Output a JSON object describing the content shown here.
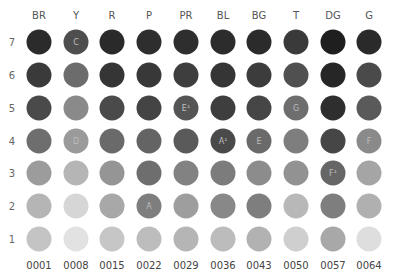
{
  "chart_data": {
    "type": "heatmap",
    "title": "",
    "xlabel": "",
    "ylabel": "",
    "columns": [
      "BR",
      "Y",
      "R",
      "P",
      "PR",
      "BL",
      "BG",
      "T",
      "DG",
      "G"
    ],
    "column_codes": [
      "0001",
      "0008",
      "0015",
      "0022",
      "0029",
      "0036",
      "0043",
      "0050",
      "0057",
      "0064"
    ],
    "rows": [
      "7",
      "6",
      "5",
      "4",
      "3",
      "2",
      "1"
    ],
    "cells": [
      {
        "col": "BR",
        "colors": [
          "#2b2b2b",
          "#3a3a3a",
          "#4a4a4a",
          "#6e6e6e",
          "#9c9c9c",
          "#b5b5b5",
          "#c4c4c4"
        ],
        "labels": [
          "",
          "",
          "",
          "",
          "",
          "",
          ""
        ]
      },
      {
        "col": "Y",
        "colors": [
          "#4e4e4e",
          "#6c6c6c",
          "#8a8a8a",
          "#9a9a9a",
          "#b5b5b5",
          "#d6d6d6",
          "#e2e2e2"
        ],
        "labels": [
          "C",
          "",
          "",
          "D",
          "",
          "",
          ""
        ]
      },
      {
        "col": "R",
        "colors": [
          "#2a2a2a",
          "#353535",
          "#4a4a4a",
          "#6a6a6a",
          "#959595",
          "#a8a8a8",
          "#c6c6c6"
        ],
        "labels": [
          "",
          "",
          "",
          "",
          "",
          "",
          ""
        ]
      },
      {
        "col": "P",
        "colors": [
          "#2e2e2e",
          "#383838",
          "#444444",
          "#646464",
          "#6e6e6e",
          "#7e7e7e",
          "#bdbdbd"
        ],
        "labels": [
          "",
          "",
          "",
          "",
          "",
          "A",
          ""
        ]
      },
      {
        "col": "PR",
        "colors": [
          "#2e2e2e",
          "#3e3e3e",
          "#555555",
          "#5a5a5a",
          "#828282",
          "#9e9e9e",
          "#b5b5b5"
        ],
        "labels": [
          "",
          "",
          "E¹",
          "",
          "",
          "",
          ""
        ]
      },
      {
        "col": "BL",
        "colors": [
          "#2c2c2c",
          "#353535",
          "#3e3e3e",
          "#4a4a4a",
          "#7c7c7c",
          "#888888",
          "#bcbcbc"
        ],
        "labels": [
          "",
          "",
          "",
          "A¹",
          "",
          "",
          ""
        ]
      },
      {
        "col": "BG",
        "colors": [
          "#2b2b2b",
          "#3c3c3c",
          "#464646",
          "#6a6a6a",
          "#8c8c8c",
          "#7e7e7e",
          "#b2b2b2"
        ],
        "labels": [
          "",
          "",
          "",
          "E",
          "",
          "",
          ""
        ]
      },
      {
        "col": "T",
        "colors": [
          "#3a3a3a",
          "#505050",
          "#6e6e6e",
          "#7e7e7e",
          "#929292",
          "#b8b8b8",
          "#cfcfcf"
        ],
        "labels": [
          "",
          "",
          "G",
          "",
          "",
          "",
          ""
        ]
      },
      {
        "col": "DG",
        "colors": [
          "#1f1f1f",
          "#262626",
          "#2e2e2e",
          "#464646",
          "#666666",
          "#7e7e7e",
          "#a8a8a8"
        ],
        "labels": [
          "",
          "",
          "",
          "",
          "F¹",
          "",
          ""
        ]
      },
      {
        "col": "G",
        "colors": [
          "#2a2a2a",
          "#4a4a4a",
          "#5a5a5a",
          "#8a8a8a",
          "#a5a5a5",
          "#b0b0b0",
          "#dedede"
        ],
        "labels": [
          "",
          "",
          "",
          "F",
          "",
          "",
          ""
        ]
      }
    ],
    "grid": false,
    "legend": "none"
  }
}
